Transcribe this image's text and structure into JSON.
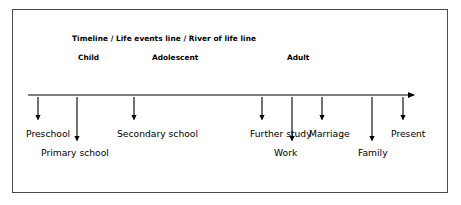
{
  "diagram": {
    "title": "Timeline / Life events line / River of life line",
    "frame": {
      "border_color": "#4a4a4a",
      "background": "#ffffff"
    },
    "axis": {
      "color": "#000000",
      "start_x": 28,
      "end_x": 421,
      "y": 95,
      "arrowhead": "right-arrow"
    },
    "stages": [
      {
        "label": "Child",
        "x": 78
      },
      {
        "label": "Adolescent",
        "x": 152
      },
      {
        "label": "Adult",
        "x": 287
      }
    ],
    "events": [
      {
        "label": "Preschool",
        "arrow_x": 38,
        "arrow_end_y": 125,
        "label_x": 26,
        "label_y": 128,
        "row": "upper"
      },
      {
        "label": "Primary school",
        "arrow_x": 77,
        "arrow_end_y": 146,
        "label_x": 41,
        "label_y": 147,
        "row": "lower"
      },
      {
        "label": "Secondary school",
        "arrow_x": 134,
        "arrow_end_y": 125,
        "label_x": 117,
        "label_y": 128,
        "row": "upper"
      },
      {
        "label": "Further study",
        "arrow_x": 262,
        "arrow_end_y": 125,
        "label_x": 250,
        "label_y": 128,
        "row": "upper"
      },
      {
        "label": "Work",
        "arrow_x": 292,
        "arrow_end_y": 146,
        "label_x": 274,
        "label_y": 147,
        "row": "lower"
      },
      {
        "label": "Marriage",
        "arrow_x": 322,
        "arrow_end_y": 125,
        "label_x": 309,
        "label_y": 128,
        "row": "upper"
      },
      {
        "label": "Family",
        "arrow_x": 372,
        "arrow_end_y": 146,
        "label_x": 358,
        "label_y": 147,
        "row": "lower"
      },
      {
        "label": "Present",
        "arrow_x": 403,
        "arrow_end_y": 125,
        "label_x": 391,
        "label_y": 128,
        "row": "upper"
      }
    ]
  }
}
